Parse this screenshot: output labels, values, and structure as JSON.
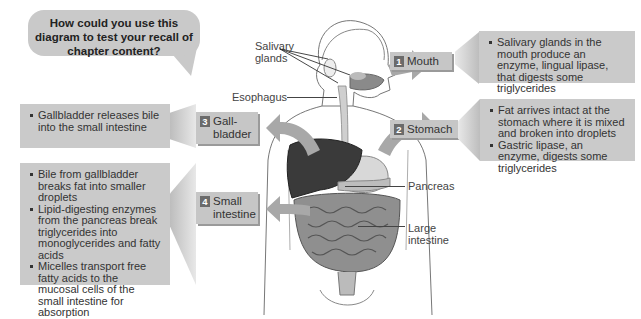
{
  "question_bubble": {
    "text": "How could you use this diagram to test your recall of chapter content?"
  },
  "anatomy_labels": {
    "salivary_glands": "Salivary glands",
    "esophagus": "Esophagus",
    "pancreas": "Pancreas",
    "large_intestine": "Large intestine"
  },
  "steps": [
    {
      "number": "1",
      "label": "Mouth",
      "notes": [
        "Salivary glands in the mouth produce an enzyme, lingual lipase, that digests some triglycerides"
      ]
    },
    {
      "number": "2",
      "label": "Stomach",
      "notes": [
        "Fat arrives intact at the stomach where it is mixed and broken into droplets",
        "Gastric lipase, an enzyme, digests some triglycerides"
      ]
    },
    {
      "number": "3",
      "label": "Gall-bladder",
      "notes": [
        "Gallbladder releases bile into the small intestine"
      ]
    },
    {
      "number": "4",
      "label": "Small intestine",
      "notes": [
        "Bile from gallbladder breaks fat into smaller droplets",
        "Lipid-digesting enzymes from the pancreas break triglycerides into monoglycerides and fatty acids",
        "Micelles transport free fatty acids to the mucosal cells of the small intestine for absorption"
      ]
    }
  ],
  "colors": {
    "box_gray": "#cacaca",
    "number_badge": "#6b6b6b",
    "liver": "#3a3a3a",
    "arrow_gray": "#9a9a9a"
  }
}
